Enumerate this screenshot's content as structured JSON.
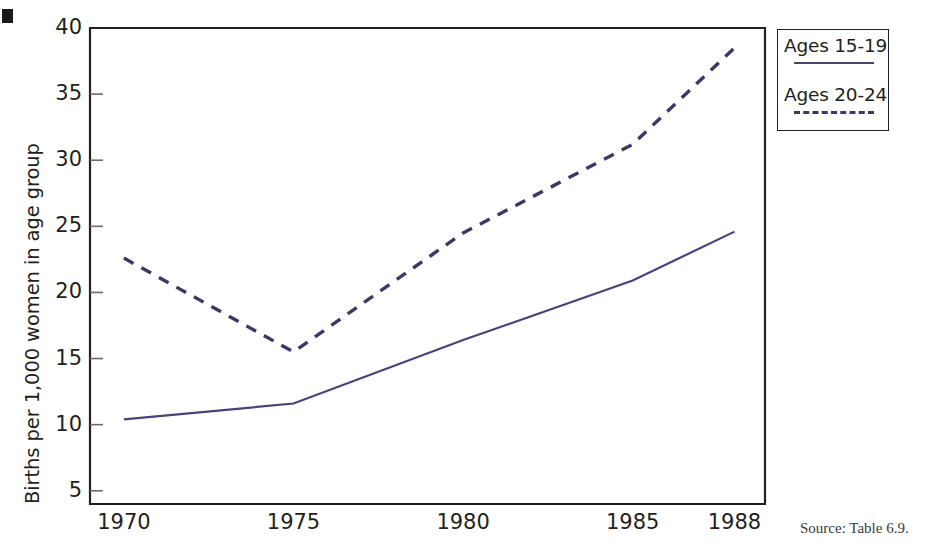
{
  "figure": {
    "marker": "black-square-bullet",
    "source_note": "Source: Table 6.9."
  },
  "legend": {
    "position": "right-outside",
    "entries": [
      {
        "label": "Ages 15-19",
        "style": "solid",
        "color": "#4a4278"
      },
      {
        "label": "Ages 20-24",
        "style": "dashed",
        "color": "#3c3866"
      }
    ]
  },
  "chart_data": {
    "type": "line",
    "title": "",
    "subtitle": "",
    "xlabel": "",
    "ylabel": "Births per 1,000 women in age group",
    "x": [
      1970,
      1975,
      1980,
      1985,
      1988
    ],
    "xtick_labels": [
      "1970",
      "1975",
      "1980",
      "1985",
      "1988"
    ],
    "xlim": [
      1969.0,
      1988.9
    ],
    "ylim": [
      4.0,
      40.0
    ],
    "ytick_labels": [
      "5",
      "10",
      "15",
      "20",
      "25",
      "30",
      "35",
      "40"
    ],
    "yticks": [
      5,
      10,
      15,
      20,
      25,
      30,
      35,
      40
    ],
    "grid": false,
    "legend_position": "right",
    "series": [
      {
        "name": "Ages 15-19",
        "style": "solid",
        "color": "#4a4278",
        "values": [
          10.4,
          11.6,
          16.4,
          20.9,
          24.6
        ]
      },
      {
        "name": "Ages 20-24",
        "style": "dashed",
        "color": "#3c3866",
        "values": [
          22.6,
          15.5,
          24.5,
          31.2,
          38.5
        ]
      }
    ],
    "annotations": []
  }
}
